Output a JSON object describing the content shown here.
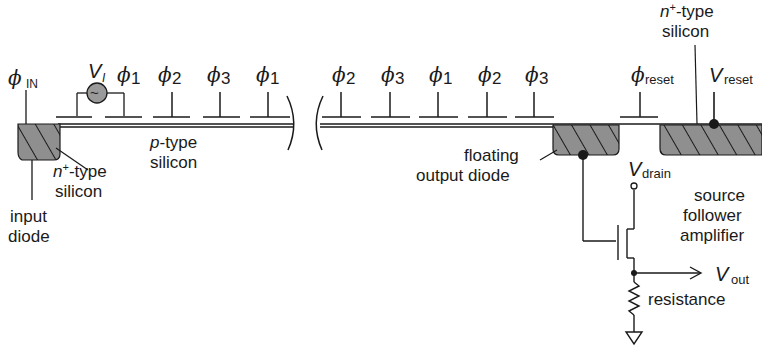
{
  "diagram": {
    "type": "ccd-cross-section",
    "colors": {
      "ink": "#1a1a1a",
      "diode_fill": "#8a8a8a",
      "source_fill": "#9a9a9a",
      "background": "#ffffff"
    },
    "labels": {
      "phi_in": {
        "symbol": "ϕ",
        "sub": "IN"
      },
      "v_i": {
        "symbol": "V",
        "sub": "I"
      },
      "phi_reset": {
        "symbol": "ϕ",
        "sub": "reset"
      },
      "v_reset": {
        "symbol": "V",
        "sub": "reset"
      },
      "v_drain": {
        "symbol": "V",
        "sub": "drain"
      },
      "v_out": {
        "symbol": "V",
        "sub": "out"
      },
      "n_type_left": {
        "line1_prefix": "n",
        "sup": "+",
        "line1_suffix": "-type",
        "line2": "silicon"
      },
      "n_type_right": {
        "line1_prefix": "n",
        "sup": "+",
        "line1_suffix": "-type",
        "line2": "silicon"
      },
      "p_type": {
        "line1_prefix": "p",
        "line1_suffix": "-type",
        "line2": "silicon"
      },
      "input_diode": {
        "line1": "input",
        "line2": "diode"
      },
      "floating_output_diode": {
        "line1": "floating",
        "line2": "output diode"
      },
      "source_follower": {
        "line1": "source",
        "line2": "follower",
        "line3": "amplifier"
      },
      "resistance": "resistance"
    },
    "gates_left": [
      {
        "symbol": "ϕ",
        "sub": "1"
      },
      {
        "symbol": "ϕ",
        "sub": "2"
      },
      {
        "symbol": "ϕ",
        "sub": "3"
      },
      {
        "symbol": "ϕ",
        "sub": "1"
      }
    ],
    "gates_right": [
      {
        "symbol": "ϕ",
        "sub": "2"
      },
      {
        "symbol": "ϕ",
        "sub": "3"
      },
      {
        "symbol": "ϕ",
        "sub": "1"
      },
      {
        "symbol": "ϕ",
        "sub": "2"
      },
      {
        "symbol": "ϕ",
        "sub": "3"
      }
    ],
    "icons": {
      "ac_source": "~",
      "ground": "ground-triangle",
      "resistor": "zigzag",
      "arrow": "arrow-right"
    }
  }
}
